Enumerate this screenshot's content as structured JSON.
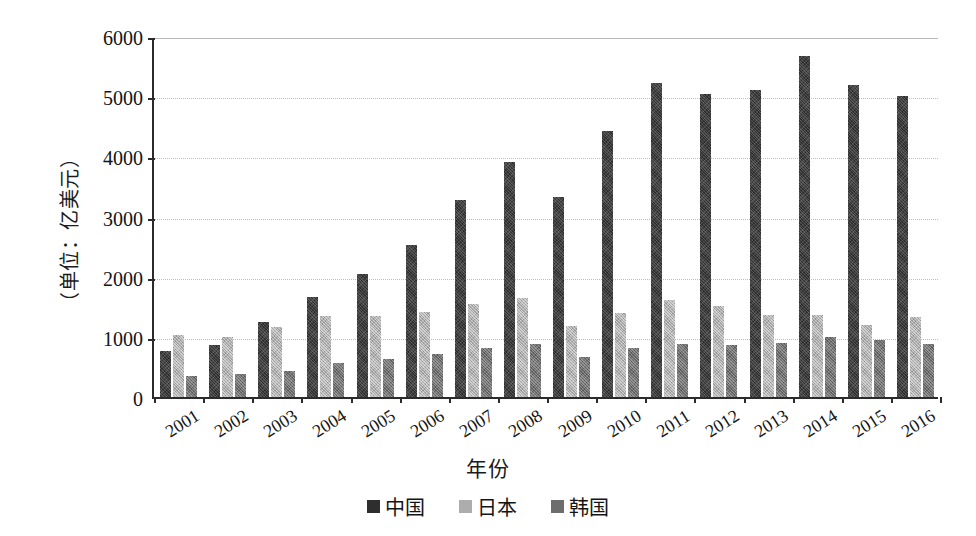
{
  "chart_data": {
    "type": "bar",
    "title": "",
    "xlabel": "年份",
    "ylabel": "（单位：亿美元）",
    "ylim": [
      0,
      6000
    ],
    "yticks": [
      0,
      1000,
      2000,
      3000,
      4000,
      5000,
      6000
    ],
    "grid": true,
    "legend_position": "bottom",
    "categories": [
      "2001",
      "2002",
      "2003",
      "2004",
      "2005",
      "2006",
      "2007",
      "2008",
      "2009",
      "2010",
      "2011",
      "2012",
      "2013",
      "2014",
      "2015",
      "2016"
    ],
    "series": [
      {
        "name": "中国",
        "color": "#2e2e2e",
        "values": [
          760,
          870,
          1240,
          1670,
          2040,
          2530,
          3280,
          3900,
          3330,
          4420,
          5220,
          5030,
          5110,
          5670,
          5180,
          5010
        ]
      },
      {
        "name": "日本",
        "color": "#adadad",
        "values": [
          1030,
          1000,
          1160,
          1340,
          1340,
          1410,
          1550,
          1650,
          1180,
          1400,
          1620,
          1520,
          1370,
          1360,
          1200,
          1330
        ]
      },
      {
        "name": "韩国",
        "color": "#6d6d6d",
        "values": [
          350,
          390,
          430,
          560,
          640,
          710,
          810,
          880,
          670,
          820,
          880,
          870,
          890,
          1000,
          950,
          880
        ]
      }
    ]
  },
  "legend": {
    "items": [
      {
        "label": "中国",
        "key": "china"
      },
      {
        "label": "日本",
        "key": "japan"
      },
      {
        "label": "韩国",
        "key": "korea"
      }
    ]
  }
}
